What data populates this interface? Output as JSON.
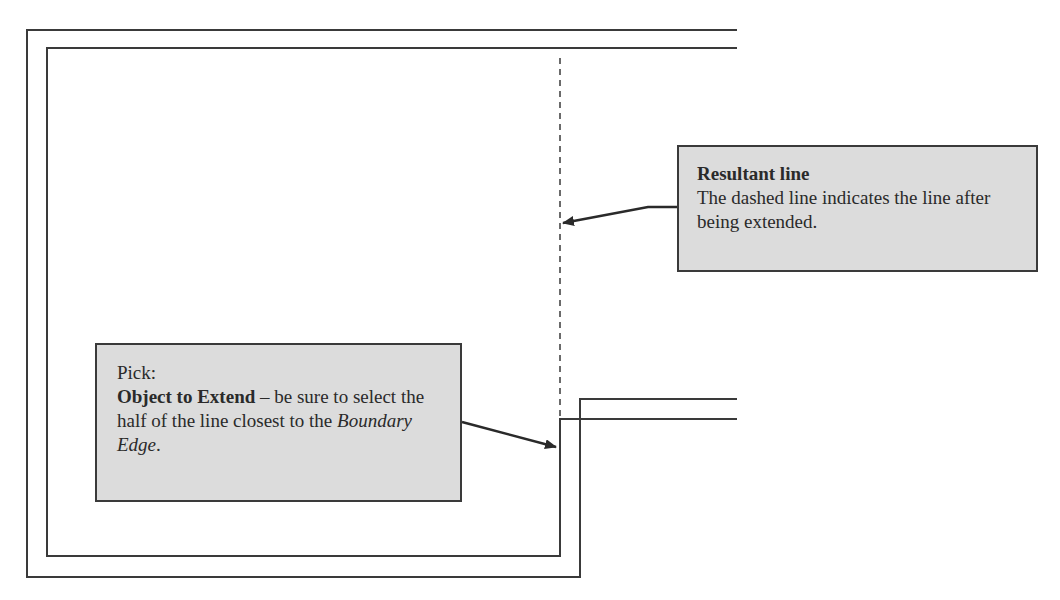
{
  "diagram": {
    "type": "cad-extend-illustration",
    "callouts": {
      "resultant": {
        "title": "Resultant line",
        "body": "The dashed line indicates the line after being extended."
      },
      "pick": {
        "label": "Pick:",
        "object_title": "Object to Extend",
        "object_sep": " – ",
        "object_desc_1": "be sure to select the half of the line closest to the ",
        "object_desc_em": "Boundary Edge",
        "object_desc_end": "."
      }
    },
    "colors": {
      "line": "#3a3a3a",
      "callout_fill": "#dcdcdc",
      "background": "#ffffff"
    }
  }
}
